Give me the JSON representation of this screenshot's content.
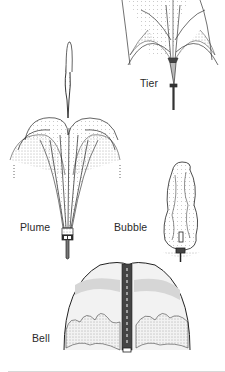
{
  "figure": {
    "colors": {
      "ink": "#1e1e1e",
      "shade": "#9a9a9a",
      "light": "#d9d9d9",
      "background": "#ffffff"
    },
    "fountains": [
      {
        "name": "Tier",
        "label": "Tier"
      },
      {
        "name": "Plume",
        "label": "Plume"
      },
      {
        "name": "Bubble",
        "label": "Bubble"
      },
      {
        "name": "Bell",
        "label": "Bell"
      }
    ]
  }
}
